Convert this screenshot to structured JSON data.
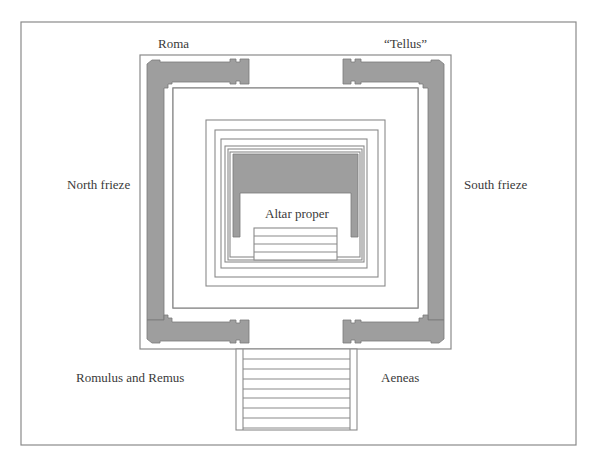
{
  "diagram": {
    "type": "architectural-plan",
    "colors": {
      "line": "#8a8a8a",
      "wall_fill": "#9e9e9e",
      "background": "#ffffff",
      "text": "#3a3a3a"
    },
    "labels": {
      "top_left": "Roma",
      "top_right": "“Tellus”",
      "left": "North frieze",
      "right": "South frieze",
      "center": "Altar proper",
      "bottom_left": "Romulus and Remus",
      "bottom_right": "Aeneas"
    },
    "stairs": {
      "front_steps": 8,
      "altar_steps": 4
    }
  }
}
